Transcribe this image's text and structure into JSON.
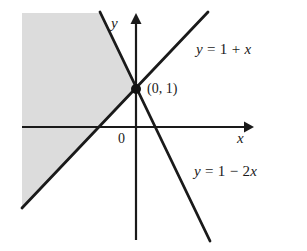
{
  "figure": {
    "background_color": "#ffffff",
    "line_color": "#1a1a1a",
    "shade_color": "#dcdcdc",
    "width": 307,
    "height": 251
  },
  "axes": {
    "x_label": "x",
    "y_label": "y",
    "origin_label": "0"
  },
  "annotations": {
    "intersection_point_label": "(0, 1)",
    "line_top_label": "y = 1 + x",
    "line_bottom_label": "y = 1 − 2x"
  },
  "chart_data": {
    "type": "line",
    "title": "",
    "xlabel": "x",
    "ylabel": "y",
    "grid": false,
    "legend": "none",
    "xlim": [
      -3.4,
      2.0
    ],
    "ylim": [
      -3.0,
      3.8
    ],
    "annotations": [
      {
        "text": "(0, 1)",
        "x": 0,
        "y": 1,
        "marker": "filled-dot"
      },
      {
        "text": "0",
        "x": -0.2,
        "y": -0.25,
        "marker": "none"
      }
    ],
    "series": [
      {
        "name": "y = 1 + x",
        "equation": "y = 1 + x",
        "slope": 1,
        "intercept": 1,
        "points": [
          [
            -3.4,
            -2.4
          ],
          [
            1.75,
            2.75
          ]
        ],
        "label_position": "upper-right"
      },
      {
        "name": "y = 1 - 2x",
        "equation": "y = 1 − 2x",
        "slope": -2,
        "intercept": 1,
        "points": [
          [
            -0.65,
            2.3
          ],
          [
            1.1,
            -1.2
          ]
        ],
        "label_position": "lower-right"
      }
    ],
    "shaded_region": {
      "description": "region to the left of both lines, above y = 1 + x and above y = 1 - 2x",
      "fill": "#dcdcdc",
      "vertex": [
        0,
        1
      ]
    }
  }
}
